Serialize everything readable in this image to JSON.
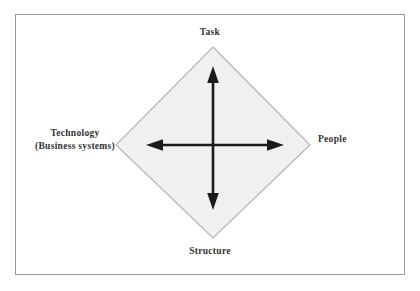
{
  "diagram": {
    "frame": {
      "border_color": "#9a9a9a"
    },
    "shape": {
      "name": "diamond",
      "fill_color": "#f0f0f0",
      "stroke_color": "#b4b4b4",
      "vertices": {
        "top": [
          213,
          47
        ],
        "right": [
          310,
          145
        ],
        "bottom": [
          213,
          238
        ],
        "left": [
          116,
          145
        ]
      }
    },
    "arrows": {
      "color": "#1a1a1a",
      "vertical": {
        "label": "vertical-double-arrow",
        "from": [
          213,
          208
        ],
        "to": [
          213,
          68
        ]
      },
      "horizontal": {
        "label": "horizontal-double-arrow",
        "from": [
          147,
          145
        ],
        "to": [
          282,
          145
        ]
      }
    },
    "labels": {
      "top": "Task",
      "right": "People",
      "bottom": "Structure",
      "left_line1": "Technology",
      "left_line2": "(Business systems)"
    }
  }
}
